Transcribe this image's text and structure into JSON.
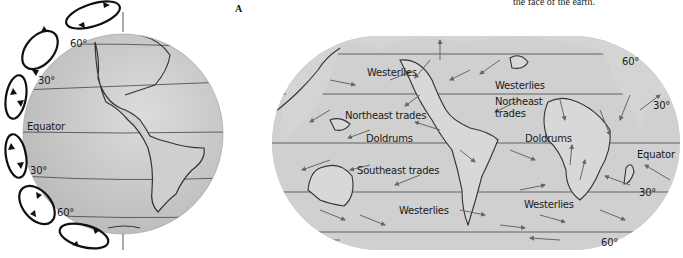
{
  "caption": {
    "partial_text": "the face of the earth."
  },
  "panel_letter": "A",
  "globe": {
    "labels": {
      "lat_60_n": "60°",
      "lat_30_n": "30°",
      "equator": "Equator",
      "lat_30_s": "30°",
      "lat_60_s": "60°"
    },
    "cells": [
      "polar-cell-north",
      "ferrel-cell-north",
      "hadley-cell-north",
      "hadley-cell-south",
      "ferrel-cell-south",
      "polar-cell-south"
    ]
  },
  "world_map": {
    "wind_labels": {
      "westerlies_nw_pacific": "Westerlies",
      "westerlies_n_atlantic": "Westerlies",
      "northeast_trades_pacific": "Northeast trades",
      "northeast_trades_atlantic_1": "Northeast",
      "northeast_trades_atlantic_2": "trades",
      "doldrums_pacific": "Doldrums",
      "doldrums_atlantic": "Doldrums",
      "southeast_trades": "Southeast trades",
      "westerlies_s_pacific": "Westerlies",
      "westerlies_s_atlantic": "Westerlies"
    },
    "lat_labels": {
      "lat_60_n": "60°",
      "lat_30_n": "30°",
      "equator": "Equator",
      "lat_30_s": "30°",
      "lat_60_s": "60°"
    }
  },
  "colors": {
    "globe_fill": "#c8c8c8",
    "map_fill": "#d4d4d4",
    "line": "#333333",
    "arrow": "#555555"
  }
}
